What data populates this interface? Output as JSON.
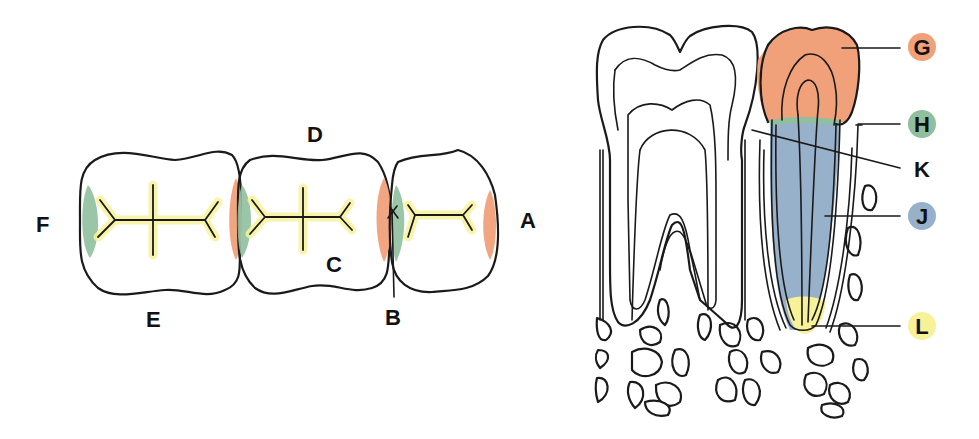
{
  "diagram": {
    "colors": {
      "orange": "#f0a17a",
      "green": "#8fbf9d",
      "blue": "#98b1cb",
      "yellow": "#f7f29a",
      "line": "#1a1a1a"
    },
    "occlusal_view": {
      "labels": {
        "A": "A",
        "B": "B",
        "C": "C",
        "D": "D",
        "E": "E",
        "F": "F"
      }
    },
    "cross_section": {
      "labels": {
        "G": "G",
        "H": "H",
        "K": "K",
        "J": "J",
        "L": "L"
      },
      "legend": [
        {
          "letter": "G",
          "color": "#f0a17a"
        },
        {
          "letter": "H",
          "color": "#8fbf9d"
        },
        {
          "letter": "K",
          "color": ""
        },
        {
          "letter": "J",
          "color": "#98b1cb"
        },
        {
          "letter": "L",
          "color": "#f7f29a"
        }
      ]
    }
  }
}
